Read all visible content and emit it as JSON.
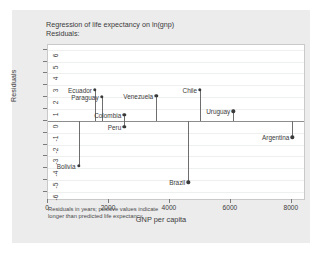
{
  "figure": {
    "title": "Regression of life expectancy on ln(gnp)\nResiduals:",
    "footnote": "Residuals in years; positive values indicate\nlonger than predicted life expectancy",
    "background_color": "#ececed",
    "plot_background_color": "#ffffff",
    "marker_color": "#3a3a3a",
    "stem_color": "#6e6e6e",
    "zero_line_color": "#8d8d8d"
  },
  "chart_data": {
    "type": "scatter",
    "title": "Regression of life expectancy on ln(gnp) Residuals:",
    "subtitle": "Residuals:",
    "xlabel": "GNP per capita",
    "ylabel": "Residuals",
    "xlim": [
      0,
      8400
    ],
    "ylim": [
      -6.6,
      6.4
    ],
    "xticks": [
      0,
      2000,
      4000,
      6000,
      8000
    ],
    "xticklabels": [
      "0",
      "2000",
      "4000",
      "6000",
      "8000"
    ],
    "yticks": [
      6,
      5,
      4,
      3,
      2,
      1,
      0,
      -1,
      -2,
      -3,
      -4,
      -5,
      -6
    ],
    "yticklabels": [
      "6",
      "5",
      "4",
      "3",
      "2",
      "1",
      "0",
      "-1",
      "-2",
      "-3",
      "-4",
      "-5",
      "-6"
    ],
    "grid": true,
    "legend": "none",
    "baseline": 0,
    "annotation": "Residuals in years; positive values indicate longer than predicted life expectancy",
    "points": [
      {
        "label": "Bolivia",
        "x": 1000,
        "y": -3.8
      },
      {
        "label": "Ecuador",
        "x": 1540,
        "y": 2.6
      },
      {
        "label": "Paraguay",
        "x": 1760,
        "y": 2.0
      },
      {
        "label": "Colombia",
        "x": 2500,
        "y": 0.5
      },
      {
        "label": "Peru",
        "x": 2500,
        "y": -0.5
      },
      {
        "label": "Venezuela",
        "x": 3550,
        "y": 2.1
      },
      {
        "label": "Brazil",
        "x": 4600,
        "y": -5.2
      },
      {
        "label": "Chile",
        "x": 4990,
        "y": 2.6
      },
      {
        "label": "Uruguay",
        "x": 6080,
        "y": 0.8
      },
      {
        "label": "Argentina",
        "x": 8020,
        "y": -1.4
      }
    ]
  }
}
